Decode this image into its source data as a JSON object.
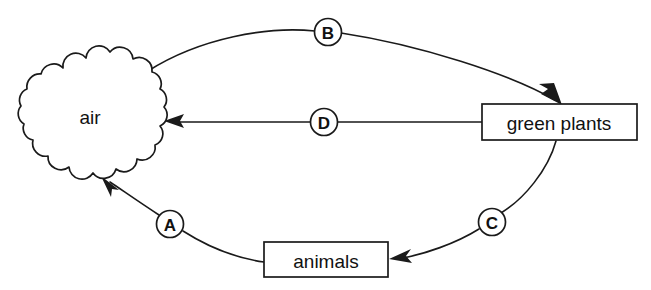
{
  "diagram": {
    "background_color": "#ffffff",
    "stroke_color": "#1a1a1a",
    "nodes": [
      {
        "id": "air",
        "label": "air",
        "shape": "cloud",
        "fill": "#ffffff",
        "center": {
          "x": 90,
          "y": 116
        }
      },
      {
        "id": "green-plants",
        "label": "green plants",
        "shape": "rectangle",
        "fill": "#ffffff",
        "center": {
          "x": 559,
          "y": 122
        }
      },
      {
        "id": "animals",
        "label": "animals",
        "shape": "rectangle",
        "fill": "#ffffff",
        "center": {
          "x": 326,
          "y": 260
        }
      }
    ],
    "arrows": [
      {
        "id": "B",
        "label": "B",
        "from": "air",
        "to": "green-plants",
        "label_center": {
          "x": 328,
          "y": 32
        },
        "style": "curved"
      },
      {
        "id": "D",
        "label": "D",
        "from": "green-plants",
        "to": "air",
        "label_center": {
          "x": 324,
          "y": 122
        },
        "style": "straight"
      },
      {
        "id": "C",
        "label": "C",
        "from": "green-plants",
        "to": "animals",
        "label_center": {
          "x": 492,
          "y": 222
        },
        "style": "curved"
      },
      {
        "id": "A",
        "label": "A",
        "from": "animals",
        "to": "air",
        "label_center": {
          "x": 170,
          "y": 224
        },
        "style": "curved"
      }
    ]
  }
}
